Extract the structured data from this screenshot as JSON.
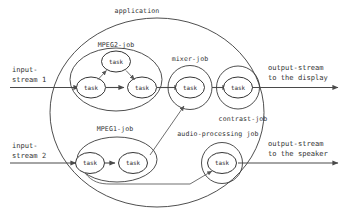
{
  "diagram": {
    "type": "task-graph",
    "containers": [
      {
        "id": "application",
        "label": "application",
        "kind": "outer-ellipse"
      },
      {
        "id": "mpeg2-job",
        "label": "MPEG2-job",
        "kind": "job-ellipse"
      },
      {
        "id": "mpeg1-job",
        "label": "MPEG1-job",
        "kind": "job-ellipse"
      },
      {
        "id": "mixer-job",
        "label": "mixer-job",
        "kind": "job-circle"
      },
      {
        "id": "contrast-job",
        "label": "contrast-job",
        "kind": "job-circle"
      },
      {
        "id": "audio-processing-job",
        "label": "audio-processing job",
        "kind": "job-circle"
      }
    ],
    "tasks": [
      {
        "id": "mpeg2-task-in",
        "label": "task",
        "job": "mpeg2-job"
      },
      {
        "id": "mpeg2-task-top",
        "label": "task",
        "job": "mpeg2-job"
      },
      {
        "id": "mpeg2-task-out",
        "label": "task",
        "job": "mpeg2-job"
      },
      {
        "id": "mixer-task",
        "label": "task",
        "job": "mixer-job"
      },
      {
        "id": "contrast-task",
        "label": "task",
        "job": "contrast-job"
      },
      {
        "id": "mpeg1-task-in",
        "label": "task",
        "job": "mpeg1-job"
      },
      {
        "id": "mpeg1-task-out",
        "label": "task",
        "job": "mpeg1-job"
      },
      {
        "id": "audio-task",
        "label": "task",
        "job": "audio-processing-job"
      }
    ],
    "io_ports": [
      {
        "id": "input-stream-1",
        "line1": "input-",
        "line2": "stream 1",
        "direction": "in"
      },
      {
        "id": "input-stream-2",
        "line1": "input-",
        "line2": "stream 2",
        "direction": "in"
      },
      {
        "id": "output-stream-display",
        "line1": "output-stream",
        "line2": "to the display",
        "direction": "out"
      },
      {
        "id": "output-stream-speaker",
        "line1": "output-stream",
        "line2": "to the speaker",
        "direction": "out"
      }
    ],
    "edges": [
      {
        "from": "input-stream-1",
        "to": "mpeg2-task-in"
      },
      {
        "from": "mpeg2-task-in",
        "to": "mpeg2-task-out"
      },
      {
        "from": "mpeg2-task-in",
        "to": "mpeg2-task-top"
      },
      {
        "from": "mpeg2-task-top",
        "to": "mpeg2-task-out"
      },
      {
        "from": "mpeg2-task-out",
        "to": "mixer-task"
      },
      {
        "from": "mixer-task",
        "to": "contrast-task"
      },
      {
        "from": "contrast-task",
        "to": "output-stream-display"
      },
      {
        "from": "input-stream-2",
        "to": "mpeg1-task-in"
      },
      {
        "from": "mpeg1-task-in",
        "to": "mpeg1-task-out"
      },
      {
        "from": "mpeg1-task-out",
        "to": "mixer-task"
      },
      {
        "from": "mpeg1-task-in",
        "to": "audio-task"
      },
      {
        "from": "audio-task",
        "to": "output-stream-speaker"
      }
    ],
    "colors": {
      "stroke": "#3b3b3b",
      "edge": "#4a4a4a",
      "text": "#333333",
      "background": "#ffffff"
    }
  }
}
